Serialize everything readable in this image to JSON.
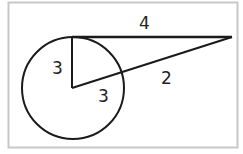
{
  "diagram": {
    "type": "circle-tangent-secant",
    "labels": {
      "tangent": "4",
      "radius_vertical": "3",
      "radius_secant": "3",
      "external_secant": "2"
    },
    "colors": {
      "stroke": "#1a1a1a",
      "frame": "#c8c8c8",
      "background": "#ffffff"
    }
  }
}
